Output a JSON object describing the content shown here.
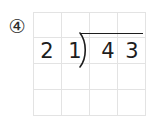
{
  "worksheet": {
    "problem_number": "④",
    "problem_number_value": 4,
    "background_color": "#ffffff",
    "ink_color": "#1d1d1d",
    "grid_line_color": "#e3e3e3"
  },
  "grid": {
    "columns": 4,
    "rows": 4,
    "cells": [
      [
        "",
        "",
        "",
        ""
      ],
      [
        "2",
        "1",
        "4",
        "3"
      ],
      [
        "",
        "",
        "",
        ""
      ],
      [
        "",
        "",
        "",
        ""
      ]
    ]
  },
  "division": {
    "divisor": "21",
    "divisor_digits": [
      "2",
      "1"
    ],
    "dividend": "43",
    "dividend_digits": [
      "4",
      "3"
    ],
    "quotient": "",
    "bracket_glyph": ")",
    "expression": "21 ) 43"
  }
}
